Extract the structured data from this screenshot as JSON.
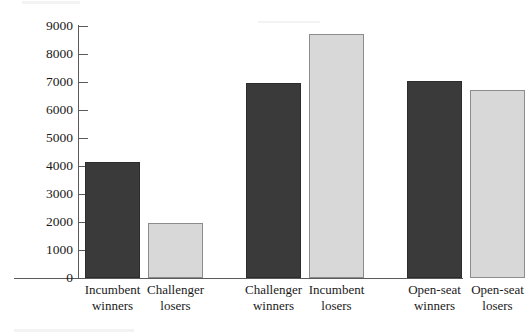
{
  "chart_data": {
    "type": "bar",
    "title": "",
    "subtitle": "",
    "xlabel": "",
    "ylabel": "",
    "ylim": [
      0,
      9000
    ],
    "ytick_step": 1000,
    "yticks": [
      0,
      1000,
      2000,
      3000,
      4000,
      5000,
      6000,
      7000,
      8000,
      9000
    ],
    "ytick_labels": [
      "0",
      "1000",
      "2000",
      "3000",
      "4000",
      "5000",
      "6000",
      "7000",
      "8000",
      "9000"
    ],
    "grid": false,
    "legend": "none",
    "categories": [
      "Incumbent winners",
      "Challenger losers",
      "Challenger winners",
      "Incumbent losers",
      "Open-seat winners",
      "Open-seat losers"
    ],
    "category_lines": [
      [
        "Incumbent",
        "winners"
      ],
      [
        "Challenger",
        "losers"
      ],
      [
        "Challenger",
        "winners"
      ],
      [
        "Incumbent",
        "losers"
      ],
      [
        "Open-seat",
        "winners"
      ],
      [
        "Open-seat",
        "losers"
      ]
    ],
    "values": [
      4150,
      1950,
      6950,
      8700,
      7050,
      6700
    ],
    "bar_styles": [
      "dark",
      "light",
      "dark",
      "light",
      "dark",
      "light"
    ],
    "groups": [
      {
        "name": "Incumbent winners vs Challenger losers",
        "indices": [
          0,
          1
        ]
      },
      {
        "name": "Challenger winners vs Incumbent losers",
        "indices": [
          2,
          3
        ]
      },
      {
        "name": "Open-seat winners vs Open-seat losers",
        "indices": [
          4,
          5
        ]
      }
    ],
    "colors": {
      "dark_bar_fill": "#3a3a3a",
      "dark_bar_border": "#2c2c2c",
      "light_bar_fill": "#d8d8d8",
      "light_bar_border": "#8c8c8c",
      "axis": "#5a5a5a",
      "text": "#1a1a1a",
      "background": "#ffffff"
    }
  }
}
